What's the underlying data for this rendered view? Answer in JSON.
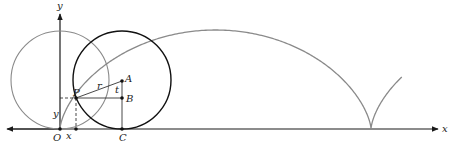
{
  "diagram": {
    "labels": {
      "y_axis": "y",
      "x_axis": "x",
      "origin": "O",
      "point_p": "P",
      "center_a": "A",
      "point_b": "B",
      "point_c": "C",
      "radius": "r",
      "angle": "t",
      "x_coord": "x",
      "y_coord": "y"
    },
    "colors": {
      "axis": "#1a1a1a",
      "rolling_circle": "#111111",
      "initial_circle": "#8a8a8a",
      "cycloid": "#8a8a8a",
      "construction": "#333333"
    }
  }
}
